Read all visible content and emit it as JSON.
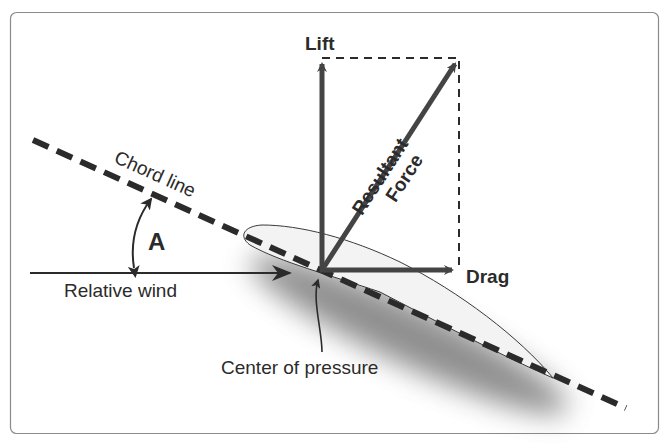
{
  "labels": {
    "lift": "Lift",
    "drag": "Drag",
    "resultant_line1": "Resultant",
    "resultant_line2": "Force",
    "chord_line": "Chord line",
    "angle": "A",
    "relative_wind": "Relative wind",
    "center_of_pressure": "Center of pressure"
  },
  "colors": {
    "vector": "#444444",
    "line": "#2b2b2b",
    "frame": "#8a8a8a",
    "airfoil_fill": "#f2f2f2",
    "shadow": "#555555"
  },
  "elements": [
    {
      "name": "chord-line",
      "type": "dashed-line"
    },
    {
      "name": "airfoil",
      "type": "shape"
    },
    {
      "name": "lift-vector",
      "type": "arrow",
      "direction": "up"
    },
    {
      "name": "drag-vector",
      "type": "arrow",
      "direction": "right"
    },
    {
      "name": "resultant-force-vector",
      "type": "arrow",
      "direction": "up-right"
    },
    {
      "name": "relative-wind-arrow",
      "type": "arrow",
      "direction": "right"
    },
    {
      "name": "angle-of-attack-arc",
      "type": "double-arrow-arc"
    },
    {
      "name": "center-of-pressure-pointer",
      "type": "arrow"
    }
  ]
}
